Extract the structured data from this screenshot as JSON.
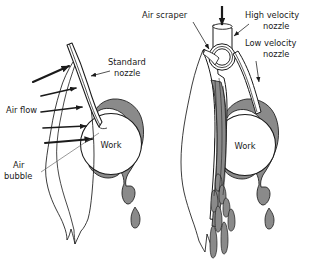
{
  "figure": {
    "background_color": "#ffffff",
    "line_color": "#1a1a1a",
    "fill_gray": "#8a8a8a",
    "fill_gray_light": "#9c9c9c",
    "width": 311,
    "height": 263
  },
  "panels": [
    {
      "id": "left-panel",
      "name": "standard-nozzle-panel",
      "labels": {
        "standard_nozzle_line1": "Standard",
        "standard_nozzle_line2": "nozzle",
        "air_flow": "Air flow",
        "air_bubble_line1": "Air",
        "air_bubble_line2": "bubble",
        "work": "Work"
      }
    },
    {
      "id": "right-panel",
      "name": "air-scraper-panel",
      "labels": {
        "air_scraper": "Air scraper",
        "high_velocity_nozzle_line1": "High velocity",
        "high_velocity_nozzle_line2": "nozzle",
        "low_velocity_nozzle_line1": "Low velocity",
        "low_velocity_nozzle_line2": "nozzle",
        "work": "Work"
      }
    }
  ],
  "annotations": {
    "air_flow_arrow_count": 5,
    "coolant_drip_count_left": 2,
    "coolant_drip_count_right": 8
  }
}
